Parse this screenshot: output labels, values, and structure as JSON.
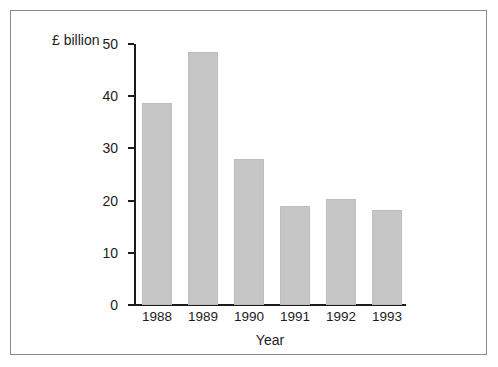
{
  "chart_data": {
    "type": "bar",
    "title": "",
    "subtitle": "",
    "xlabel": "Year",
    "ylabel": "£ billion",
    "categories": [
      "1988",
      "1989",
      "1990",
      "1991",
      "1992",
      "1993"
    ],
    "values": [
      38.7,
      48.4,
      28.0,
      19.0,
      20.3,
      18.2
    ],
    "ylim": [
      0,
      50
    ],
    "yticks": [
      0,
      10,
      20,
      30,
      40,
      50
    ],
    "ytick_labels": [
      "0",
      "10",
      "20",
      "30",
      "40",
      "50"
    ],
    "grid": false,
    "legend": null,
    "legend_position": "none",
    "bar_color": "#c6c6c6",
    "axis_color": "#1c1c1c",
    "frame_color": "#8a8a8a",
    "background_color": "#ffffff"
  }
}
